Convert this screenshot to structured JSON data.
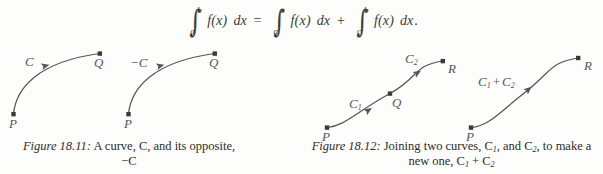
{
  "page": {
    "background_color": "#fdfdfc",
    "ink_color": "#2b2b2b",
    "curve_color": "#56565a"
  },
  "equation": {
    "name": "additivity-of-definite-integral",
    "integral_1": {
      "lower": "a",
      "upper": "b",
      "integrand": "f(x)",
      "differential": "dx"
    },
    "relation": "=",
    "integral_2": {
      "lower": "a",
      "upper": "c",
      "integrand": "f(x)",
      "differential": "dx"
    },
    "operator": "+",
    "integral_3": {
      "lower": "c",
      "upper": "b",
      "integrand": "f(x)",
      "differential": "dx"
    },
    "terminator": "."
  },
  "figure_left": {
    "number": "Figure 18.11:",
    "caption_line_1": "A curve, C, and its opposite,",
    "caption_line_2": "−C",
    "caption_text": "Figure 18.11: A curve, C, and its opposite, −C",
    "curves": [
      {
        "label": "C",
        "start_point": "P",
        "end_point": "Q",
        "direction": "arrow points from Q toward P"
      },
      {
        "label": "−C",
        "start_point": "P",
        "end_point": "Q",
        "direction": "arrow points from Q toward P"
      }
    ],
    "labels": {
      "curve1_name": "C",
      "curve1_start": "P",
      "curve1_end": "Q",
      "curve2_name": "−C",
      "curve2_start": "P",
      "curve2_end": "Q"
    }
  },
  "figure_right": {
    "number": "Figure 18.12:",
    "caption_line_1": "Joining two curves, C",
    "caption_line_1_sub_a": "1",
    "caption_line_1_mid": ", and C",
    "caption_line_1_sub_b": "2",
    "caption_line_1_end": ", to make a",
    "caption_line_2_pre": "new one, C",
    "caption_line_2_sub_a": "1",
    "caption_line_2_plus": " + C",
    "caption_line_2_sub_b": "2",
    "caption_text": "Figure 18.12: Joining two curves, C1, and C2, to make a new one, C1 + C2",
    "curves": [
      {
        "label": "C1",
        "start_point": "P",
        "end_point": "Q",
        "direction": "arrow points from P toward Q"
      },
      {
        "label": "C2",
        "start_point": "Q",
        "end_point": "R",
        "direction": "arrow points from Q toward R"
      },
      {
        "label": "C1 + C2",
        "start_point": "P",
        "end_point": "R",
        "direction": "arrow points from P toward R"
      }
    ],
    "labels": {
      "c1_base": "C",
      "c1_sub": "1",
      "c2_base": "C",
      "c2_sub": "2",
      "sum_base": "C",
      "sum_sub_a": "1",
      "sum_plus": "+",
      "sum_base_b": "C",
      "sum_sub_b": "2",
      "left_start": "P",
      "left_mid": "Q",
      "left_end": "R",
      "right_start": "P",
      "right_end": "R"
    }
  }
}
